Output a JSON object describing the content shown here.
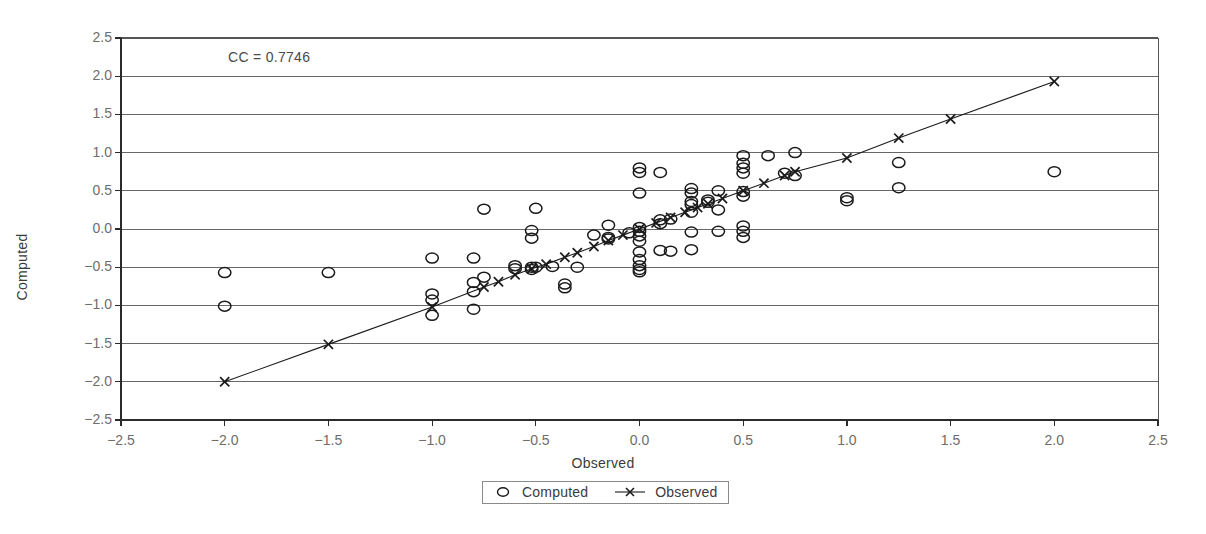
{
  "chart_data": {
    "type": "scatter",
    "title": "",
    "xlabel": "Observed",
    "ylabel": "Computed",
    "xlim": [
      -2.5,
      2.5
    ],
    "ylim": [
      -2.5,
      2.5
    ],
    "xticks": [
      "-2.5",
      "-2.0",
      "-1.5",
      "-1.0",
      "-0.5",
      "0.0",
      "0.5",
      "1.0",
      "1.5",
      "2.0",
      "2.5"
    ],
    "yticks": [
      "-2.5",
      "-2.0",
      "-1.5",
      "-1.0",
      "-0.5",
      "0.0",
      "0.5",
      "1.0",
      "1.5",
      "2.0",
      "2.5"
    ],
    "xtick_values": [
      -2.5,
      -2.0,
      -1.5,
      -1.0,
      -0.5,
      0.0,
      0.5,
      1.0,
      1.5,
      2.0,
      2.5
    ],
    "ytick_values": [
      -2.5,
      -2.0,
      -1.5,
      -1.0,
      -0.5,
      0.0,
      0.5,
      1.0,
      1.5,
      2.0,
      2.5
    ],
    "grid": "horizontal",
    "legend_position": "bottom-center",
    "annotations": [
      {
        "text": "CC = 0.7746",
        "x": -1.75,
        "y": 2.22
      }
    ],
    "series": [
      {
        "name": "Computed",
        "marker": "open-circle",
        "line": "none",
        "color": "#1a1a1a",
        "points": [
          [
            -2.0,
            -0.57
          ],
          [
            -2.0,
            -1.01
          ],
          [
            -1.5,
            -0.57
          ],
          [
            -1.0,
            -0.38
          ],
          [
            -1.0,
            -0.85
          ],
          [
            -1.0,
            -0.93
          ],
          [
            -1.0,
            -1.13
          ],
          [
            -0.8,
            -0.38
          ],
          [
            -0.8,
            -0.7
          ],
          [
            -0.8,
            -0.82
          ],
          [
            -0.8,
            -1.05
          ],
          [
            -0.75,
            0.26
          ],
          [
            -0.75,
            -0.63
          ],
          [
            -0.6,
            -0.48
          ],
          [
            -0.6,
            -0.52
          ],
          [
            -0.52,
            -0.02
          ],
          [
            -0.52,
            -0.12
          ],
          [
            -0.52,
            -0.5
          ],
          [
            -0.52,
            -0.53
          ],
          [
            -0.5,
            0.27
          ],
          [
            -0.5,
            -0.5
          ],
          [
            -0.42,
            -0.49
          ],
          [
            -0.36,
            -0.72
          ],
          [
            -0.36,
            -0.77
          ],
          [
            -0.3,
            -0.5
          ],
          [
            -0.22,
            -0.08
          ],
          [
            -0.15,
            0.05
          ],
          [
            -0.15,
            -0.11
          ],
          [
            -0.15,
            -0.13
          ],
          [
            -0.05,
            -0.05
          ],
          [
            0.0,
            0.8
          ],
          [
            0.0,
            0.74
          ],
          [
            0.0,
            0.47
          ],
          [
            0.0,
            0.02
          ],
          [
            0.0,
            -0.03
          ],
          [
            0.0,
            -0.09
          ],
          [
            0.0,
            -0.16
          ],
          [
            0.0,
            -0.3
          ],
          [
            0.0,
            -0.4
          ],
          [
            0.0,
            -0.48
          ],
          [
            0.0,
            -0.53
          ],
          [
            0.0,
            -0.56
          ],
          [
            0.1,
            0.74
          ],
          [
            0.1,
            0.12
          ],
          [
            0.1,
            0.07
          ],
          [
            0.1,
            -0.28
          ],
          [
            0.15,
            0.13
          ],
          [
            0.15,
            -0.29
          ],
          [
            0.25,
            0.53
          ],
          [
            0.25,
            0.47
          ],
          [
            0.25,
            0.36
          ],
          [
            0.25,
            0.32
          ],
          [
            0.25,
            0.22
          ],
          [
            0.25,
            -0.04
          ],
          [
            0.25,
            -0.27
          ],
          [
            0.33,
            0.38
          ],
          [
            0.33,
            0.35
          ],
          [
            0.38,
            0.5
          ],
          [
            0.38,
            0.25
          ],
          [
            0.38,
            -0.03
          ],
          [
            0.5,
            0.96
          ],
          [
            0.5,
            0.86
          ],
          [
            0.5,
            0.8
          ],
          [
            0.5,
            0.73
          ],
          [
            0.5,
            0.49
          ],
          [
            0.5,
            0.43
          ],
          [
            0.5,
            0.04
          ],
          [
            0.5,
            -0.03
          ],
          [
            0.5,
            -0.11
          ],
          [
            0.62,
            0.96
          ],
          [
            0.7,
            0.73
          ],
          [
            0.75,
            1.0
          ],
          [
            0.75,
            0.7
          ],
          [
            1.0,
            0.41
          ],
          [
            1.0,
            0.37
          ],
          [
            1.25,
            0.87
          ],
          [
            1.25,
            0.54
          ],
          [
            2.0,
            0.75
          ]
        ]
      },
      {
        "name": "Observed",
        "marker": "x",
        "line": "solid",
        "color": "#1a1a1a",
        "points": [
          [
            -2.0,
            -2.0
          ],
          [
            -1.5,
            -1.51
          ],
          [
            -1.0,
            -1.02
          ],
          [
            -0.75,
            -0.76
          ],
          [
            -0.68,
            -0.69
          ],
          [
            -0.6,
            -0.6
          ],
          [
            -0.52,
            -0.52
          ],
          [
            -0.45,
            -0.46
          ],
          [
            -0.36,
            -0.37
          ],
          [
            -0.3,
            -0.31
          ],
          [
            -0.22,
            -0.23
          ],
          [
            -0.15,
            -0.15
          ],
          [
            -0.08,
            -0.08
          ],
          [
            0.0,
            0.0
          ],
          [
            0.08,
            0.08
          ],
          [
            0.15,
            0.15
          ],
          [
            0.22,
            0.22
          ],
          [
            0.28,
            0.28
          ],
          [
            0.33,
            0.33
          ],
          [
            0.4,
            0.4
          ],
          [
            0.5,
            0.5
          ],
          [
            0.6,
            0.6
          ],
          [
            0.7,
            0.7
          ],
          [
            0.75,
            0.75
          ],
          [
            1.0,
            0.93
          ],
          [
            1.25,
            1.19
          ],
          [
            1.5,
            1.44
          ],
          [
            2.0,
            1.93
          ]
        ]
      }
    ]
  },
  "legend": {
    "items": [
      {
        "label": "Computed",
        "marker": "open-circle"
      },
      {
        "label": "Observed",
        "marker": "x-line"
      }
    ]
  }
}
